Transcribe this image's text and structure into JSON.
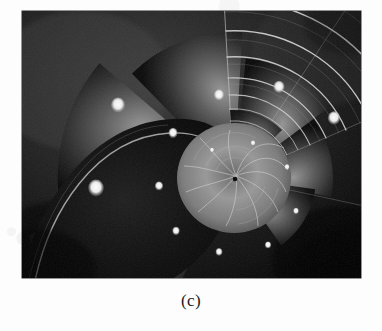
{
  "figure": {
    "caption": "(c)",
    "subject_label": "nautilus-shell-cross-section",
    "image_box": {
      "x": 22,
      "y": 11,
      "width": 339,
      "height": 267
    },
    "colors": {
      "page_background": "#fdfdfd",
      "image_background": "#0c0c0c",
      "shell_dark": "#101010",
      "shell_mid": "#5a5a5a",
      "shell_light": "#b9b9b9",
      "septum_highlight": "#e8e8e8",
      "siphuncle_white": "#fdfdfd",
      "caption_text": "#1b1b1b"
    },
    "spiral": {
      "center_x": 234,
      "center_y": 178,
      "growth_factor": 1.265,
      "chamber_count": 17,
      "inner_whorl_radius": 52,
      "outer_radius": 232
    },
    "siphuncle_points": [
      {
        "x": 212,
        "y": 150,
        "size": 2.1
      },
      {
        "x": 253,
        "y": 143,
        "size": 2.4
      },
      {
        "x": 287,
        "y": 167,
        "size": 2.6
      },
      {
        "x": 296,
        "y": 211,
        "size": 2.9
      },
      {
        "x": 268,
        "y": 245,
        "size": 3.2
      },
      {
        "x": 219,
        "y": 252,
        "size": 3.5
      },
      {
        "x": 176,
        "y": 231,
        "size": 3.9
      },
      {
        "x": 159,
        "y": 186,
        "size": 4.4
      },
      {
        "x": 173,
        "y": 133,
        "size": 4.9
      },
      {
        "x": 219,
        "y": 95,
        "size": 5.5
      },
      {
        "x": 279,
        "y": 87,
        "size": 6.1
      },
      {
        "x": 334,
        "y": 118,
        "size": 6.8
      },
      {
        "x": 360,
        "y": 182,
        "size": 7.5
      },
      {
        "x": 118,
        "y": 105,
        "size": 8.3
      },
      {
        "x": 96,
        "y": 188,
        "size": 9.2
      }
    ]
  }
}
